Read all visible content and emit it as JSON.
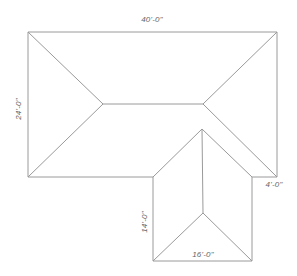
{
  "diagram": {
    "type": "roof-plan",
    "colors": {
      "line": "#9a9a9a",
      "text": "#666666",
      "background": "#ffffff"
    },
    "dimensions": {
      "top_width": "40'-0\"",
      "left_height": "24'-0\"",
      "step_offset": "4'-0\"",
      "wing_depth": "14'-0\"",
      "wing_width": "16'-0\""
    }
  }
}
